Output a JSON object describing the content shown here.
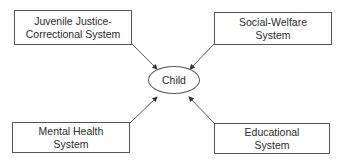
{
  "diagram": {
    "center": {
      "label": "Child"
    },
    "nodes": [
      {
        "id": "juvenile",
        "lines": [
          "Juvenile Justice-",
          "Correctional System"
        ]
      },
      {
        "id": "social",
        "lines": [
          "Social-Welfare",
          "System"
        ]
      },
      {
        "id": "mental",
        "lines": [
          "Mental Health",
          "System"
        ]
      },
      {
        "id": "educational",
        "lines": [
          "Educational",
          "System"
        ]
      }
    ],
    "edges": [
      {
        "from": "juvenile",
        "to": "child"
      },
      {
        "from": "social",
        "to": "child"
      },
      {
        "from": "mental",
        "to": "child"
      },
      {
        "from": "educational",
        "to": "child"
      }
    ]
  }
}
